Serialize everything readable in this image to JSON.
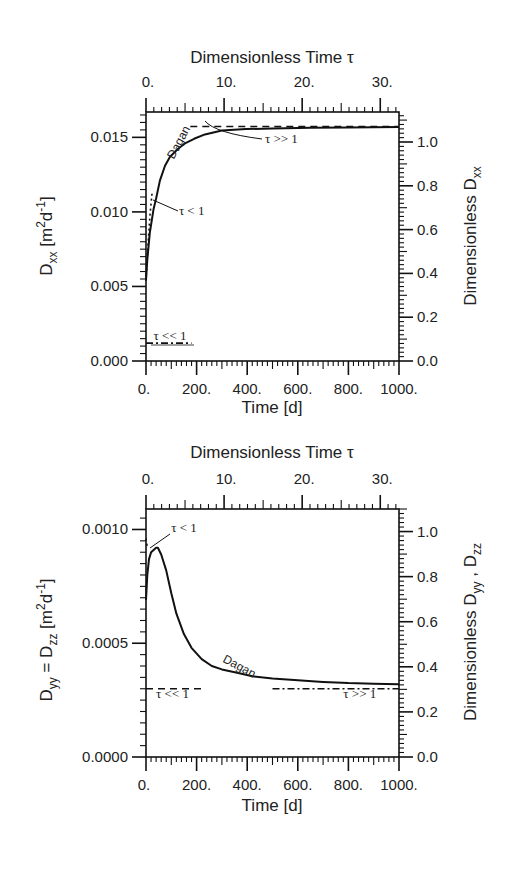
{
  "chart_data": [
    {
      "type": "line",
      "panel": "top",
      "top_axis": {
        "label": "Dimensionless Time τ",
        "ticks": [
          "0.",
          "10.",
          "20.",
          "30."
        ],
        "tick_values": [
          0,
          10,
          20,
          30
        ],
        "range": [
          0,
          32.4
        ]
      },
      "xlabel": "Time [d]",
      "x_ticks": [
        "0.",
        "200.",
        "400.",
        "600.",
        "800.",
        "1000."
      ],
      "xlim": [
        0,
        1000
      ],
      "ylabel": {
        "main": "D",
        "sub": "xx",
        "unit_open": " [m",
        "sup1": "2",
        "unit_mid": "d",
        "sup2": "-1",
        "unit_close": "]"
      },
      "y_ticks": [
        "0.000",
        "0.005",
        "0.010",
        "0.015"
      ],
      "ylim": [
        0,
        0.0167
      ],
      "right_axis": {
        "label_main": "Dimensionless D",
        "label_sub": "xx",
        "ticks": [
          "0.0",
          "0.2",
          "0.4",
          "0.6",
          "0.8",
          "1.0"
        ],
        "range": [
          0,
          1.137
        ]
      },
      "grid": false,
      "series": [
        {
          "name": "Dagan",
          "style": "solid",
          "x": [
            0,
            5,
            15,
            30,
            40,
            55,
            75,
            95,
            125,
            154,
            190,
            233,
            300,
            395,
            500,
            650,
            800,
            1000
          ],
          "y": [
            0.0054,
            0.0068,
            0.0086,
            0.0102,
            0.0109,
            0.0121,
            0.0131,
            0.0137,
            0.0142,
            0.0146,
            0.0149,
            0.0152,
            0.01545,
            0.01555,
            0.0156,
            0.01565,
            0.01567,
            0.0157
          ]
        },
        {
          "name": "τ >> 1",
          "style": "dashed",
          "x": [
            175,
            1000
          ],
          "y": [
            0.01573,
            0.01573
          ]
        },
        {
          "name": "τ < 1",
          "style": "dotted",
          "x": [
            0,
            8,
            16,
            24
          ],
          "y": [
            0.0054,
            0.0078,
            0.0098,
            0.0113
          ]
        },
        {
          "name": "τ << 1",
          "style": "dashdot",
          "x": [
            0,
            180
          ],
          "y": [
            0.0012,
            0.0012
          ]
        }
      ],
      "annotations": [
        {
          "text": "Dagan",
          "x": 110,
          "y": 0.0135,
          "rotate": -62
        },
        {
          "text": "τ >> 1",
          "x": 470,
          "y": 0.0146
        },
        {
          "text": "τ < 1",
          "x": 130,
          "y": 0.0098
        },
        {
          "text": "τ << 1",
          "x": 30,
          "y": 0.0014
        }
      ]
    },
    {
      "type": "line",
      "panel": "bottom",
      "top_axis": {
        "label": "Dimensionless Time τ",
        "ticks": [
          "0.",
          "10.",
          "20.",
          "30."
        ],
        "tick_values": [
          0,
          10,
          20,
          30
        ],
        "range": [
          0,
          32.4
        ]
      },
      "xlabel": "Time [d]",
      "x_ticks": [
        "0.",
        "200.",
        "400.",
        "600.",
        "800.",
        "1000."
      ],
      "xlim": [
        0,
        1000
      ],
      "ylabel": {
        "main": "D",
        "sub": "yy",
        "eq": " = D",
        "sub2": "zz",
        "unit_open": "  [m",
        "sup1": "2",
        "unit_mid": "d",
        "sup2": "-1",
        "unit_close": "]"
      },
      "y_ticks": [
        "0.0000",
        "0.0005",
        "0.0010"
      ],
      "ylim": [
        0,
        0.00109
      ],
      "right_axis": {
        "label_main": "Dimensionless D",
        "label_sub": "yy",
        "label_sep": " , D",
        "label_sub2": "zz",
        "ticks": [
          "0.0",
          "0.2",
          "0.4",
          "0.6",
          "0.8",
          "1.0"
        ],
        "range": [
          0,
          1.1
        ]
      },
      "grid": false,
      "series": [
        {
          "name": "Dagan",
          "style": "solid",
          "x": [
            0,
            5,
            12,
            20,
            30,
            40,
            47,
            60,
            80,
            100,
            120,
            150,
            180,
            220,
            260,
            300,
            360,
            420,
            500,
            600,
            700,
            800,
            900,
            1000
          ],
          "y": [
            0.00069,
            0.0008,
            0.00087,
            0.0009,
            0.00091,
            0.00092,
            0.00092,
            0.00089,
            0.00082,
            0.00072,
            0.00063,
            0.00054,
            0.00048,
            0.00043,
            0.0004,
            0.000385,
            0.00037,
            0.000355,
            0.000345,
            0.000337,
            0.00033,
            0.000325,
            0.000322,
            0.00032
          ]
        },
        {
          "name": "τ < 1",
          "style": "dotted",
          "x": [
            0,
            4,
            8
          ],
          "y": [
            0.00096,
            0.00093,
            0.00094
          ]
        },
        {
          "name": "τ << 1",
          "style": "dashed",
          "x": [
            0,
            220
          ],
          "y": [
            0.0003,
            0.0003
          ]
        },
        {
          "name": "τ >> 1",
          "style": "dashdot",
          "x": [
            500,
            1000
          ],
          "y": [
            0.0003,
            0.0003
          ]
        }
      ],
      "annotations": [
        {
          "text": "τ < 1",
          "x": 100,
          "y": 0.00099
        },
        {
          "text": "Dagan",
          "x": 300,
          "y": 0.00042,
          "rotate": 28
        },
        {
          "text": "τ << 1",
          "x": 40,
          "y": 0.00026
        },
        {
          "text": "τ >> 1",
          "x": 780,
          "y": 0.00026
        }
      ]
    }
  ]
}
